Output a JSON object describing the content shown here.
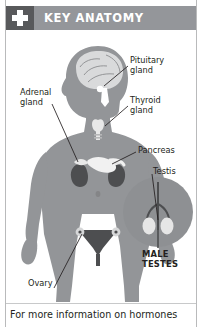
{
  "card": {
    "accent_dark": "#58595b",
    "accent_mid": "#94969a",
    "body_fill": "#939598",
    "organ_dark": "#4d4e50",
    "organ_light": "#e8e8e8",
    "text_color": "#231f20"
  },
  "header": {
    "icon": "medical-cross-icon",
    "title": "KEY ANATOMY"
  },
  "illustration": {
    "subject": "human-body-endocrine-figure",
    "labels": [
      {
        "id": "pituitary",
        "text": "Pituitary\ngland"
      },
      {
        "id": "thyroid",
        "text": "Thyroid\ngland"
      },
      {
        "id": "adrenal",
        "text": "Adrenal\ngland"
      },
      {
        "id": "pancreas",
        "text": "Pancreas"
      },
      {
        "id": "testis",
        "text": "Testis"
      },
      {
        "id": "ovary",
        "text": "Ovary"
      }
    ],
    "inset": {
      "id": "male-testes-inset",
      "caption": "MALE\nTESTES"
    }
  },
  "footer": {
    "text": "For more information on hormones"
  }
}
